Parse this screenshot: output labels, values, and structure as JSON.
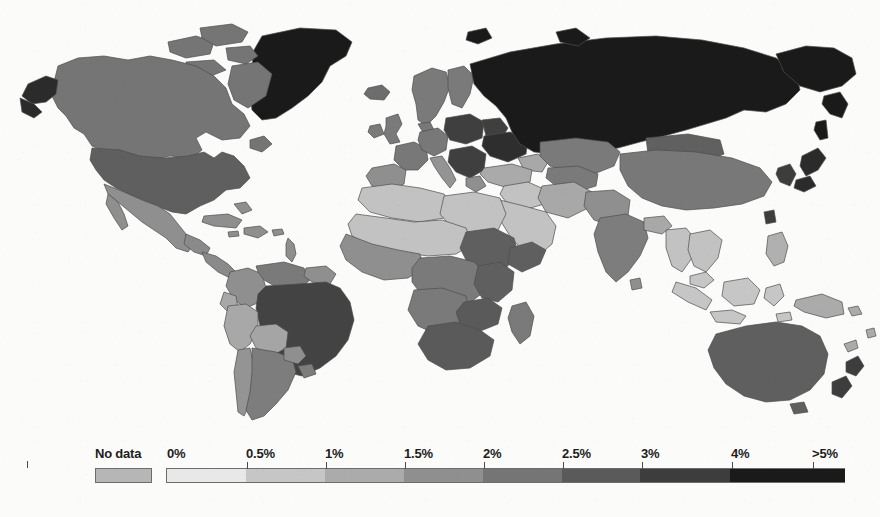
{
  "figure": {
    "type": "choropleth-world-map",
    "background_color": "#fbfbfa",
    "ocean_color": "#fbfbfa",
    "border_color": "#4d4d4d"
  },
  "chart_data": {
    "type": "heatmap",
    "title": "",
    "subtitle": "",
    "xlabel": "",
    "ylabel": "",
    "projection": "equirectangular",
    "grid": false,
    "legend_position": "bottom",
    "colorbar": {
      "orientation": "horizontal",
      "no_data_label": "No data",
      "no_data_color": "#b6b6b6",
      "tick_labels": [
        "0%",
        "0.5%",
        "1%",
        "1.5%",
        "2%",
        "2.5%",
        "3%",
        "4%",
        ">5%"
      ],
      "tick_values": [
        0,
        0.5,
        1,
        1.5,
        2,
        2.5,
        3,
        4,
        5
      ],
      "segments": [
        {
          "from": "0%",
          "to": "0.5%",
          "color": "#e8e8e8"
        },
        {
          "from": "0.5%",
          "to": "1%",
          "color": "#c6c6c6"
        },
        {
          "from": "1%",
          "to": "1.5%",
          "color": "#ababab"
        },
        {
          "from": "1.5%",
          "to": "2%",
          "color": "#8f8f8f"
        },
        {
          "from": "2%",
          "to": "2.5%",
          "color": "#757575"
        },
        {
          "from": "2.5%",
          "to": "3%",
          "color": "#5a5a5a"
        },
        {
          "from": "3%",
          "to": "4%",
          "color": "#3d3d3d"
        },
        {
          "from": "4%",
          "to": ">5%",
          "color": "#1a1a1a"
        }
      ]
    },
    "regions": [
      {
        "name": "Greenland",
        "bin": ">5%",
        "color": "#1a1a1a"
      },
      {
        "name": "Russia",
        "bin": ">5%",
        "color": "#1a1a1a"
      },
      {
        "name": "Alaska",
        "bin": "4-5%",
        "color": "#2b2b2b"
      },
      {
        "name": "Canada",
        "bin": "2-2.5%",
        "color": "#757575"
      },
      {
        "name": "United States",
        "bin": "2.5-3%",
        "color": "#5f5f5f"
      },
      {
        "name": "Mexico",
        "bin": "1.5-2%",
        "color": "#8f8f8f"
      },
      {
        "name": "Central America",
        "bin": "1.5-2%",
        "color": "#8a8a8a"
      },
      {
        "name": "Caribbean",
        "bin": "1.5-2%",
        "color": "#8f8f8f"
      },
      {
        "name": "Brazil",
        "bin": "3-4%",
        "color": "#434343"
      },
      {
        "name": "Argentina",
        "bin": "2-2.5%",
        "color": "#7d7d7d"
      },
      {
        "name": "Chile",
        "bin": "1.5-2%",
        "color": "#949494"
      },
      {
        "name": "Peru",
        "bin": "1-1.5%",
        "color": "#a8a8a8"
      },
      {
        "name": "Colombia",
        "bin": "1.5-2%",
        "color": "#8f8f8f"
      },
      {
        "name": "Venezuela",
        "bin": "2-2.5%",
        "color": "#7a7a7a"
      },
      {
        "name": "Bolivia",
        "bin": "1-1.5%",
        "color": "#a5a5a5"
      },
      {
        "name": "United Kingdom",
        "bin": "2-2.5%",
        "color": "#7a7a7a"
      },
      {
        "name": "Scandinavia",
        "bin": "2-2.5%",
        "color": "#7a7a7a"
      },
      {
        "name": "Western Europe",
        "bin": "2-2.5%",
        "color": "#787878"
      },
      {
        "name": "Eastern Europe",
        "bin": "3-4%",
        "color": "#3f3f3f"
      },
      {
        "name": "Ukraine",
        "bin": "4-5%",
        "color": "#2e2e2e"
      },
      {
        "name": "Spain",
        "bin": "1.5-2%",
        "color": "#8f8f8f"
      },
      {
        "name": "Italy",
        "bin": "1.5-2%",
        "color": "#949494"
      },
      {
        "name": "Turkey",
        "bin": "1-1.5%",
        "color": "#aaaaaa"
      },
      {
        "name": "North Africa",
        "bin": "0.5-1%",
        "color": "#c2c2c2"
      },
      {
        "name": "Sahel",
        "bin": "0.5-1%",
        "color": "#c2c2c2"
      },
      {
        "name": "West Africa",
        "bin": "1.5-2%",
        "color": "#8f8f8f"
      },
      {
        "name": "Central Africa",
        "bin": "2-2.5%",
        "color": "#7a7a7a"
      },
      {
        "name": "East Africa",
        "bin": "2.5-3%",
        "color": "#5f5f5f"
      },
      {
        "name": "Southern Africa",
        "bin": "2.5-3%",
        "color": "#5a5a5a"
      },
      {
        "name": "Madagascar",
        "bin": "2-2.5%",
        "color": "#7a7a7a"
      },
      {
        "name": "Arabian Peninsula",
        "bin": "0.5-1%",
        "color": "#c2c2c2"
      },
      {
        "name": "Iran",
        "bin": "1-1.5%",
        "color": "#a8a8a8"
      },
      {
        "name": "Central Asia",
        "bin": "2-2.5%",
        "color": "#7a7a7a"
      },
      {
        "name": "India",
        "bin": "2-2.5%",
        "color": "#7d7d7d"
      },
      {
        "name": "China",
        "bin": "2-2.5%",
        "color": "#787878"
      },
      {
        "name": "Mongolia",
        "bin": "2.5-3%",
        "color": "#606060"
      },
      {
        "name": "Japan",
        "bin": "4-5%",
        "color": "#2b2b2b"
      },
      {
        "name": "Korea",
        "bin": "3-4%",
        "color": "#3d3d3d"
      },
      {
        "name": "Southeast Asia",
        "bin": "0.5-1%",
        "color": "#c2c2c2"
      },
      {
        "name": "Indonesia",
        "bin": "0.5-1%",
        "color": "#c6c6c6"
      },
      {
        "name": "Philippines",
        "bin": "1-1.5%",
        "color": "#b0b0b0"
      },
      {
        "name": "Papua New Guinea",
        "bin": "1-1.5%",
        "color": "#ababab"
      },
      {
        "name": "Australia",
        "bin": "2.5-3%",
        "color": "#5f5f5f"
      },
      {
        "name": "New Zealand",
        "bin": "3-4%",
        "color": "#3d3d3d"
      }
    ]
  },
  "legend": {
    "no_data": "No data",
    "ticks": [
      {
        "label": "0%",
        "x": 167
      },
      {
        "label": "0.5%",
        "x": 246
      },
      {
        "label": "1%",
        "x": 325
      },
      {
        "label": "1.5%",
        "x": 404
      },
      {
        "label": "2%",
        "x": 483
      },
      {
        "label": "2.5%",
        "x": 562
      },
      {
        "label": "3%",
        "x": 641
      },
      {
        "label": "4%",
        "x": 731
      },
      {
        "label": ">5%",
        "x": 812
      }
    ]
  }
}
